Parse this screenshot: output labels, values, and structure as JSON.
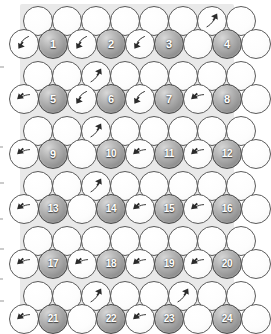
{
  "figure": {
    "title": "",
    "background_color": "#ffffff",
    "filled_circle_color": "#9a9a9a",
    "filled_circle_border_color": "#4a4a4a",
    "empty_circle_color": "#ffffff",
    "empty_circle_border_color": "#5b5b5b",
    "number_text_color": "#ffffff",
    "arrow_color": "#2b2b2b",
    "interstitial_tint_color": "#e9e9e9"
  },
  "grid": {
    "rows": 9,
    "circle_diameter": 30,
    "row_pitch": 33,
    "column_pitch": 29,
    "numbered_count": 24,
    "numbers": [
      1,
      2,
      3,
      4,
      5,
      6,
      7,
      8,
      9,
      10,
      11,
      12,
      13,
      14,
      15,
      16,
      17,
      18,
      19,
      20,
      21,
      22,
      23,
      24
    ],
    "rows_data": [
      {
        "index": 0,
        "type": "plain",
        "x_offset": 23,
        "y": 6,
        "cells": [
          {
            "kind": "empty",
            "arrow": "none"
          },
          {
            "kind": "empty",
            "arrow": "none"
          },
          {
            "kind": "empty",
            "arrow": "none"
          },
          {
            "kind": "empty",
            "arrow": "none"
          },
          {
            "kind": "empty",
            "arrow": "none"
          },
          {
            "kind": "empty",
            "arrow": "none"
          },
          {
            "kind": "empty",
            "arrow": "up-right"
          },
          {
            "kind": "empty",
            "arrow": "none"
          }
        ]
      },
      {
        "index": 1,
        "type": "numbered",
        "x_offset": 9,
        "y": 29,
        "cells": [
          {
            "kind": "empty",
            "arrow": "down-left"
          },
          {
            "kind": "filled",
            "label": "1"
          },
          {
            "kind": "empty",
            "arrow": "down-left"
          },
          {
            "kind": "filled",
            "label": "2"
          },
          {
            "kind": "empty",
            "arrow": "down-left"
          },
          {
            "kind": "filled",
            "label": "3"
          },
          {
            "kind": "empty",
            "arrow": "none"
          },
          {
            "kind": "filled",
            "label": "4"
          },
          {
            "kind": "empty",
            "arrow": "none"
          }
        ]
      },
      {
        "index": 2,
        "type": "plain",
        "x_offset": 23,
        "y": 61,
        "cells": [
          {
            "kind": "empty",
            "arrow": "none"
          },
          {
            "kind": "empty",
            "arrow": "none"
          },
          {
            "kind": "empty",
            "arrow": "up-right"
          },
          {
            "kind": "empty",
            "arrow": "none"
          },
          {
            "kind": "empty",
            "arrow": "none"
          },
          {
            "kind": "empty",
            "arrow": "none"
          },
          {
            "kind": "empty",
            "arrow": "none"
          },
          {
            "kind": "empty",
            "arrow": "none"
          }
        ]
      },
      {
        "index": 3,
        "type": "numbered",
        "x_offset": 9,
        "y": 84,
        "cells": [
          {
            "kind": "empty",
            "arrow": "left"
          },
          {
            "kind": "filled",
            "label": "5"
          },
          {
            "kind": "empty",
            "arrow": "down-left"
          },
          {
            "kind": "filled",
            "label": "6"
          },
          {
            "kind": "empty",
            "arrow": "down-left"
          },
          {
            "kind": "filled",
            "label": "7"
          },
          {
            "kind": "empty",
            "arrow": "left"
          },
          {
            "kind": "filled",
            "label": "8"
          },
          {
            "kind": "empty",
            "arrow": "none"
          }
        ]
      },
      {
        "index": 4,
        "type": "plain",
        "x_offset": 23,
        "y": 116,
        "cells": [
          {
            "kind": "empty",
            "arrow": "none"
          },
          {
            "kind": "empty",
            "arrow": "none"
          },
          {
            "kind": "empty",
            "arrow": "up-right"
          },
          {
            "kind": "empty",
            "arrow": "none"
          },
          {
            "kind": "empty",
            "arrow": "none"
          },
          {
            "kind": "empty",
            "arrow": "none"
          },
          {
            "kind": "empty",
            "arrow": "none"
          },
          {
            "kind": "empty",
            "arrow": "none"
          }
        ]
      },
      {
        "index": 5,
        "type": "numbered",
        "x_offset": 9,
        "y": 139,
        "cells": [
          {
            "kind": "empty",
            "arrow": "left"
          },
          {
            "kind": "filled",
            "label": "9"
          },
          {
            "kind": "empty",
            "arrow": "none"
          },
          {
            "kind": "filled",
            "label": "10"
          },
          {
            "kind": "empty",
            "arrow": "left"
          },
          {
            "kind": "filled",
            "label": "11"
          },
          {
            "kind": "empty",
            "arrow": "left"
          },
          {
            "kind": "filled",
            "label": "12"
          },
          {
            "kind": "empty",
            "arrow": "none"
          }
        ]
      },
      {
        "index": 6,
        "type": "plain",
        "x_offset": 23,
        "y": 171,
        "cells": [
          {
            "kind": "empty",
            "arrow": "none"
          },
          {
            "kind": "empty",
            "arrow": "none"
          },
          {
            "kind": "empty",
            "arrow": "up-right"
          },
          {
            "kind": "empty",
            "arrow": "none"
          },
          {
            "kind": "empty",
            "arrow": "none"
          },
          {
            "kind": "empty",
            "arrow": "none"
          },
          {
            "kind": "empty",
            "arrow": "none"
          },
          {
            "kind": "empty",
            "arrow": "none"
          }
        ]
      },
      {
        "index": 7,
        "type": "numbered",
        "x_offset": 9,
        "y": 194,
        "cells": [
          {
            "kind": "empty",
            "arrow": "left"
          },
          {
            "kind": "filled",
            "label": "13"
          },
          {
            "kind": "empty",
            "arrow": "none"
          },
          {
            "kind": "filled",
            "label": "14"
          },
          {
            "kind": "empty",
            "arrow": "left"
          },
          {
            "kind": "filled",
            "label": "15"
          },
          {
            "kind": "empty",
            "arrow": "left"
          },
          {
            "kind": "filled",
            "label": "16"
          },
          {
            "kind": "empty",
            "arrow": "none"
          }
        ]
      },
      {
        "index": 8,
        "type": "plain",
        "x_offset": 23,
        "y": 226,
        "cells": [
          {
            "kind": "empty",
            "arrow": "none"
          },
          {
            "kind": "empty",
            "arrow": "none"
          },
          {
            "kind": "empty",
            "arrow": "none"
          },
          {
            "kind": "empty",
            "arrow": "none"
          },
          {
            "kind": "empty",
            "arrow": "none"
          },
          {
            "kind": "empty",
            "arrow": "none"
          },
          {
            "kind": "empty",
            "arrow": "none"
          },
          {
            "kind": "empty",
            "arrow": "none"
          }
        ]
      },
      {
        "index": 9,
        "type": "numbered",
        "x_offset": 9,
        "y": 249,
        "cells": [
          {
            "kind": "empty",
            "arrow": "left"
          },
          {
            "kind": "filled",
            "label": "17"
          },
          {
            "kind": "empty",
            "arrow": "left"
          },
          {
            "kind": "filled",
            "label": "18"
          },
          {
            "kind": "empty",
            "arrow": "left"
          },
          {
            "kind": "filled",
            "label": "19"
          },
          {
            "kind": "empty",
            "arrow": "left"
          },
          {
            "kind": "filled",
            "label": "20"
          },
          {
            "kind": "empty",
            "arrow": "none"
          }
        ]
      },
      {
        "index": 10,
        "type": "plain",
        "x_offset": 23,
        "y": 281,
        "cells": [
          {
            "kind": "empty",
            "arrow": "none"
          },
          {
            "kind": "empty",
            "arrow": "none"
          },
          {
            "kind": "empty",
            "arrow": "up-right"
          },
          {
            "kind": "empty",
            "arrow": "none"
          },
          {
            "kind": "empty",
            "arrow": "none"
          },
          {
            "kind": "empty",
            "arrow": "up-right"
          },
          {
            "kind": "empty",
            "arrow": "none"
          },
          {
            "kind": "empty",
            "arrow": "none"
          }
        ]
      },
      {
        "index": 11,
        "type": "numbered",
        "x_offset": 9,
        "y": 304,
        "cells": [
          {
            "kind": "empty",
            "arrow": "left"
          },
          {
            "kind": "filled",
            "label": "21"
          },
          {
            "kind": "empty",
            "arrow": "none"
          },
          {
            "kind": "filled",
            "label": "22"
          },
          {
            "kind": "empty",
            "arrow": "left"
          },
          {
            "kind": "filled",
            "label": "23"
          },
          {
            "kind": "empty",
            "arrow": "none"
          },
          {
            "kind": "filled",
            "label": "24"
          },
          {
            "kind": "empty",
            "arrow": "none"
          }
        ]
      },
      {
        "index": 12,
        "type": "plain",
        "x_offset": 23,
        "y": 336,
        "cells": [
          {
            "kind": "empty",
            "arrow": "none"
          },
          {
            "kind": "empty",
            "arrow": "none"
          },
          {
            "kind": "empty",
            "arrow": "none"
          },
          {
            "kind": "empty",
            "arrow": "none"
          },
          {
            "kind": "empty",
            "arrow": "none"
          },
          {
            "kind": "empty",
            "arrow": "none"
          },
          {
            "kind": "empty",
            "arrow": "none"
          },
          {
            "kind": "empty",
            "arrow": "none"
          }
        ]
      }
    ]
  },
  "margin_marks": [
    {
      "x": 0,
      "y": 66,
      "w": 4,
      "h": 2
    },
    {
      "x": 0,
      "y": 146,
      "w": 3,
      "h": 2
    },
    {
      "x": 0,
      "y": 182,
      "w": 4,
      "h": 2
    },
    {
      "x": 0,
      "y": 218,
      "w": 3,
      "h": 2
    },
    {
      "x": 0,
      "y": 248,
      "w": 4,
      "h": 2
    },
    {
      "x": 0,
      "y": 278,
      "w": 3,
      "h": 2
    },
    {
      "x": 0,
      "y": 300,
      "w": 4,
      "h": 2
    }
  ]
}
